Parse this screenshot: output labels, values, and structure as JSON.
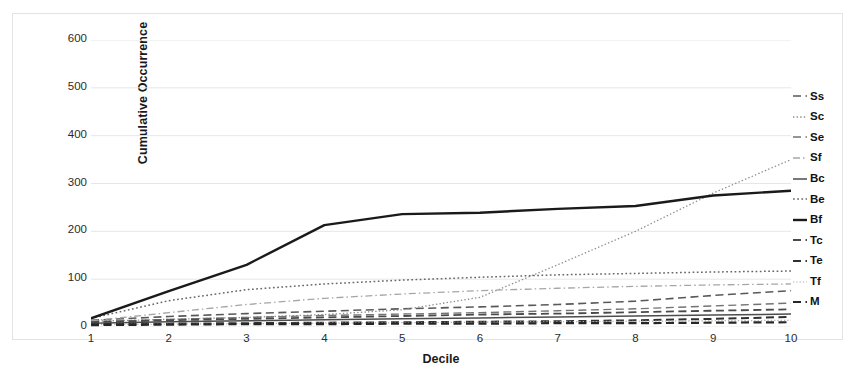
{
  "chart_data": {
    "type": "line",
    "title": "",
    "xlabel": "Decile",
    "ylabel": "Cumulative Occurrence",
    "x": [
      1,
      2,
      3,
      4,
      5,
      6,
      7,
      8,
      9,
      10
    ],
    "xticklabels": [
      "1",
      "2",
      "3",
      "4",
      "5",
      "6",
      "7",
      "8",
      "9",
      "10"
    ],
    "yticklabels": [
      "0",
      "100",
      "200",
      "300",
      "400",
      "500",
      "600"
    ],
    "yticks": [
      0,
      100,
      200,
      300,
      400,
      500,
      600
    ],
    "ylim": [
      0,
      600
    ],
    "xlim": [
      1,
      10
    ],
    "grid": "horizontal",
    "legend_position": "right",
    "series": [
      {
        "name": "Ss",
        "style": "dashed",
        "color": "#595959",
        "width": 1.6,
        "values": [
          14,
          22,
          28,
          33,
          38,
          42,
          47,
          54,
          66,
          76
        ]
      },
      {
        "name": "Sc",
        "style": "dotted",
        "color": "#8c8c8c",
        "width": 1.3,
        "values": [
          12,
          16,
          20,
          26,
          36,
          62,
          130,
          200,
          280,
          350
        ]
      },
      {
        "name": "Se",
        "style": "dashed",
        "color": "#737373",
        "width": 1.4,
        "values": [
          11,
          16,
          20,
          24,
          27,
          30,
          34,
          38,
          44,
          50
        ]
      },
      {
        "name": "Sf",
        "style": "dashdot",
        "color": "#a6a6a6",
        "width": 1.3,
        "values": [
          13,
          30,
          47,
          60,
          69,
          76,
          81,
          85,
          88,
          90
        ]
      },
      {
        "name": "Bc",
        "style": "solid",
        "color": "#4d4d4d",
        "width": 1.5,
        "values": [
          8,
          11,
          13,
          15,
          17,
          19,
          21,
          23,
          25,
          27
        ]
      },
      {
        "name": "Be",
        "style": "dotted",
        "color": "#666666",
        "width": 1.5,
        "values": [
          18,
          55,
          78,
          90,
          98,
          104,
          109,
          112,
          115,
          117
        ]
      },
      {
        "name": "Bf",
        "style": "solid",
        "color": "#1a1a1a",
        "width": 2.4,
        "values": [
          18,
          75,
          130,
          213,
          236,
          239,
          247,
          253,
          275,
          285
        ]
      },
      {
        "name": "Tc",
        "style": "dashed",
        "color": "#4a4a4a",
        "width": 1.8,
        "values": [
          10,
          14,
          17,
          20,
          23,
          26,
          28,
          31,
          34,
          37
        ]
      },
      {
        "name": "Te",
        "style": "dashed",
        "color": "#303030",
        "width": 2.0,
        "values": [
          6,
          7,
          8,
          9,
          10,
          11,
          12,
          14,
          17,
          21
        ]
      },
      {
        "name": "Tf",
        "style": "dotted",
        "color": "#b0b0b0",
        "width": 1.2,
        "values": [
          5,
          6,
          7,
          8,
          9,
          10,
          11,
          12,
          13,
          14
        ]
      },
      {
        "name": "M",
        "style": "dashed",
        "color": "#262626",
        "width": 2.2,
        "values": [
          4,
          5,
          6,
          6,
          7,
          7,
          8,
          8,
          9,
          10
        ]
      }
    ]
  },
  "axes": {
    "y_title": "Cumulative Occurrence",
    "x_title": "Decile"
  },
  "colors": {
    "grid": "#e6e6e6",
    "frame": "#e3e3e3",
    "text": "#2b2b2b",
    "title_text": "#1a1a1a",
    "background": "#ffffff"
  }
}
